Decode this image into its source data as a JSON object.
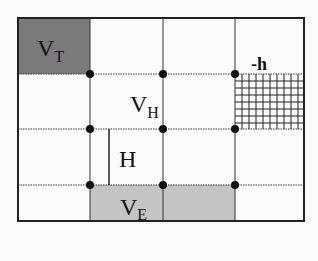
{
  "diagram": {
    "labels": {
      "vt_main": "V",
      "vt_sub": "T",
      "vh_main": "V",
      "vh_sub": "H",
      "h": "H",
      "ve_main": "V",
      "ve_sub": "E",
      "minus_h": "-h"
    },
    "colors": {
      "vt_fill": "#7a7a7a",
      "ve_fill": "#c4c4c4",
      "line": "#222222",
      "background": "#fbfbfb"
    },
    "grid": {
      "columns_x": [
        18,
        90,
        163,
        235,
        304
      ],
      "rows_y": [
        18,
        74,
        129,
        185,
        221
      ]
    },
    "nodes": [
      [
        90,
        74
      ],
      [
        163,
        74
      ],
      [
        235,
        74
      ],
      [
        90,
        129
      ],
      [
        163,
        129
      ],
      [
        235,
        129
      ],
      [
        90,
        185
      ],
      [
        163,
        185
      ],
      [
        235,
        185
      ]
    ]
  }
}
